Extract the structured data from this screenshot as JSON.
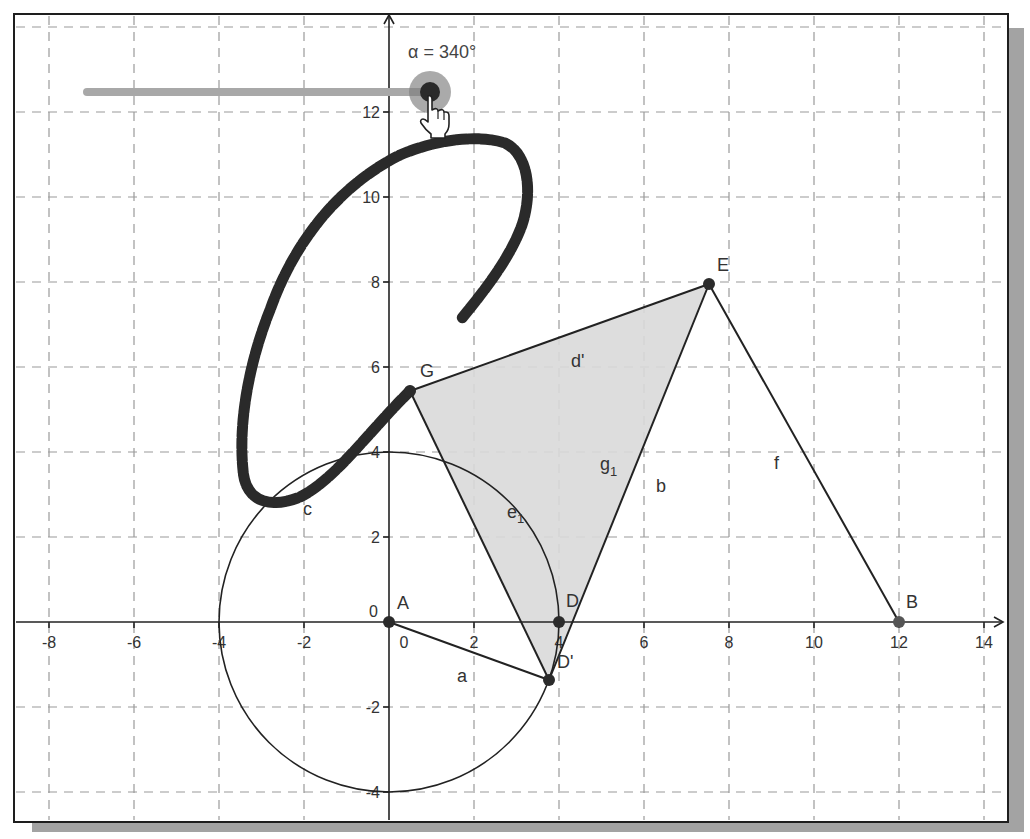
{
  "app": {
    "kind": "geometry-graphics-view"
  },
  "slider": {
    "label": "α = 340°",
    "variable": "α",
    "value": 340,
    "unit": "°"
  },
  "axes": {
    "x_ticks": [
      "-8",
      "-6",
      "-4",
      "-2",
      "0",
      "2",
      "4",
      "6",
      "8",
      "10",
      "12",
      "14"
    ],
    "y_ticks": [
      "-4",
      "-2",
      "0",
      "2",
      "4",
      "6",
      "8",
      "10",
      "12"
    ],
    "origin_label": "0"
  },
  "points": {
    "A": {
      "label": "A",
      "x": 0,
      "y": 0
    },
    "B": {
      "label": "B",
      "x": 12,
      "y": 0
    },
    "D": {
      "label": "D",
      "x": 4,
      "y": 0
    },
    "D_prime": {
      "label": "D'",
      "x": 3.76,
      "y": -1.37
    },
    "E": {
      "label": "E",
      "x": 7.6,
      "y": 7.9
    },
    "G": {
      "label": "G",
      "x": 0.5,
      "y": 5.4
    }
  },
  "objects": {
    "segment_a": "a",
    "segment_b": "b",
    "locus_c": "c",
    "segment_d_prime": "d'",
    "segment_e1_base": "e",
    "segment_e1_sub": "1",
    "segment_f": "f",
    "segment_g1_base": "g",
    "segment_g1_sub": "1"
  },
  "circle": {
    "center": "A",
    "radius": 4
  },
  "colors": {
    "grid": "#9a9a9a",
    "axis": "#222222",
    "polygon_fill": "#d9d9d9",
    "locus": "#2a2a2a",
    "point": "#2b2b2b",
    "point_B": "#555555",
    "slider_track": "#a8a8a8",
    "shadow": "#9e9e9e"
  }
}
